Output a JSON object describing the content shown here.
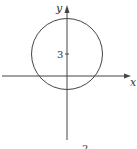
{
  "diagram": {
    "x_axis_label": "x",
    "y_axis_label": "y",
    "tick_label": "3",
    "caption_fragment": "2",
    "circle": {
      "center": [
        0,
        3
      ],
      "description": "circle centered on y-axis at y=3, crossing x-axis"
    },
    "stroke_color": "#444444"
  }
}
